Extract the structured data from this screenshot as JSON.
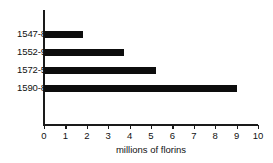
{
  "chart_data": {
    "type": "bar",
    "orientation": "horizontal",
    "title": "",
    "subtitle": "",
    "xlabel": "millions of florins",
    "ylabel": "",
    "categories": [
      "1547-8",
      "1552-9",
      "1572-5",
      "1590-8"
    ],
    "values": [
      1.8,
      3.75,
      5.25,
      9.0
    ],
    "series": [
      {
        "name": "",
        "values": [
          1.8,
          3.75,
          5.25,
          9.0
        ]
      }
    ],
    "xlim": [
      0,
      10
    ],
    "xticks": [
      0,
      1,
      2,
      3,
      4,
      5,
      6,
      7,
      8,
      9,
      10
    ],
    "xtick_labels": [
      "0",
      "1",
      "2",
      "3",
      "4",
      "5",
      "6",
      "7",
      "8",
      "9",
      "10"
    ],
    "grid": false,
    "legend": false,
    "legend_position": "none",
    "bar_color": "#0d0d0d",
    "background_color": "#ffffff",
    "axis_color": "#1a1a1a",
    "text_color": "#111111",
    "annotations": []
  }
}
